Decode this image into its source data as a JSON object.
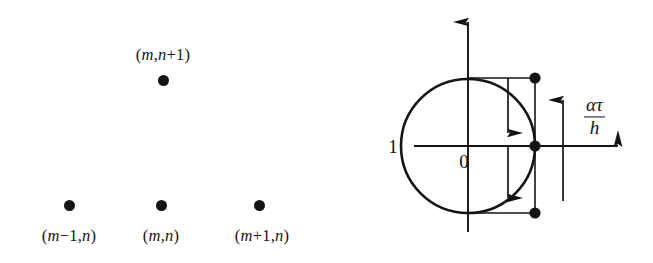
{
  "figure": {
    "background_color": "#ffffff",
    "ink_color": "#141414",
    "width": 653,
    "height": 263,
    "panels": [
      {
        "name": "stencil",
        "description": "Finite-difference stencil with four grid nodes"
      },
      {
        "name": "unit-circle",
        "description": "Unit circle in complex plane with amplification factor construction"
      }
    ]
  },
  "stencil": {
    "nodes": [
      {
        "id": "node-m-n-plus-1",
        "label_parts": [
          {
            "text": "(",
            "italic": false
          },
          {
            "text": "m",
            "italic": true
          },
          {
            "text": ",",
            "italic": false
          },
          {
            "text": "n",
            "italic": true
          },
          {
            "text": "+1)",
            "italic": false
          }
        ],
        "label_text": "(m,n+1)",
        "x": 163,
        "y": 80,
        "label_x": 163,
        "label_y": 55
      },
      {
        "id": "node-m-minus-1-n",
        "label_parts": [
          {
            "text": "(",
            "italic": false
          },
          {
            "text": "m",
            "italic": true
          },
          {
            "text": "−1,",
            "italic": false
          },
          {
            "text": "n",
            "italic": true
          },
          {
            "text": ")",
            "italic": false
          }
        ],
        "label_text": "(m−1,n)",
        "x": 69,
        "y": 205,
        "label_x": 69,
        "label_y": 236
      },
      {
        "id": "node-m-n",
        "label_parts": [
          {
            "text": "(",
            "italic": false
          },
          {
            "text": "m",
            "italic": true
          },
          {
            "text": ",",
            "italic": false
          },
          {
            "text": "n",
            "italic": true
          },
          {
            "text": ")",
            "italic": false
          }
        ],
        "label_text": "(m,n)",
        "x": 161,
        "y": 205,
        "label_x": 161,
        "label_y": 236
      },
      {
        "id": "node-m-plus-1-n",
        "label_parts": [
          {
            "text": "(",
            "italic": false
          },
          {
            "text": "m",
            "italic": true
          },
          {
            "text": "+1,",
            "italic": false
          },
          {
            "text": "n",
            "italic": true
          },
          {
            "text": ")",
            "italic": false
          }
        ],
        "label_text": "(m+1,n)",
        "x": 259,
        "y": 205,
        "label_x": 262,
        "label_y": 236
      }
    ]
  },
  "unit_circle": {
    "origin_label": "0",
    "radius_label": "1",
    "fraction": {
      "numerator": "ατ",
      "denominator": "h",
      "reads_as": "alpha tau over h"
    },
    "geometry": {
      "center_x": 468,
      "center_y": 146,
      "radius": 67,
      "vertical_axis_top_y": 14,
      "vertical_axis_bottom_y": 232,
      "horizontal_axis_left_x": 414,
      "horizontal_axis_right_x": 628,
      "construction_x": 535,
      "inner_arrow_x": 508,
      "offset_arrow_x": 563
    },
    "markers": [
      {
        "id": "marker-upper",
        "x": 535,
        "y": 78
      },
      {
        "id": "marker-axis",
        "x": 535,
        "y": 146
      },
      {
        "id": "marker-lower",
        "x": 535,
        "y": 213
      }
    ],
    "labels": {
      "radius_label_x": 393,
      "radius_label_y": 147,
      "origin_label_x": 464,
      "origin_label_y": 162,
      "fraction_x": 584,
      "fraction_y": 117
    }
  }
}
